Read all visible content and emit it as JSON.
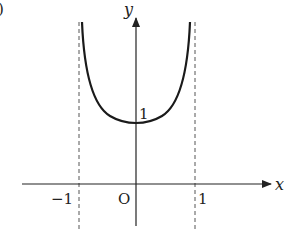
{
  "figure": {
    "corner_mark": ")",
    "axes": {
      "x_label": "x",
      "y_label": "y",
      "origin_label": "O"
    },
    "ticks": {
      "x_neg": "−1",
      "x_pos": "1",
      "y_one": "1"
    },
    "asymptotes": [
      {
        "x": -1,
        "style": "dashed"
      },
      {
        "x": 1,
        "style": "dashed"
      }
    ],
    "curve": {
      "description": "U-shaped curve symmetric about y-axis, minimum at (0,1), vertical asymptotes at x=-1 and x=1",
      "min_point": [
        0,
        1
      ],
      "color": "#1a1a1a"
    }
  }
}
